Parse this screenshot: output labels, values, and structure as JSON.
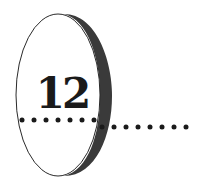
{
  "chapter": {
    "number": "12",
    "colors": {
      "ink": "#1a1a1a",
      "crescent": "#3a3a3a",
      "background": "#ffffff"
    },
    "dots_inside_count": 7,
    "dots_outside_count": 8
  }
}
